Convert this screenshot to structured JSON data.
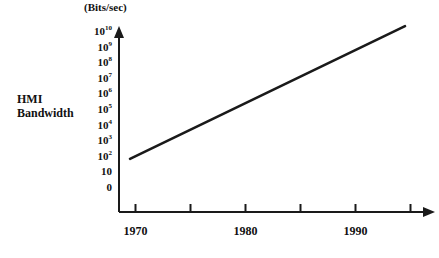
{
  "chart_data": {
    "type": "line",
    "title": "",
    "subtitle": "",
    "unit_label": "(Bits/sec)",
    "ylabel_line1": "HMI",
    "ylabel_line2": "Bandwidth",
    "xlabel": "",
    "yscale": "log",
    "ytick_labels": [
      "10",
      "",
      "10",
      "10",
      "10",
      "10",
      "10",
      "10",
      "10",
      "10",
      "10",
      "0"
    ],
    "y_ticks": [
      {
        "mantissa": "10",
        "exponent": "10",
        "value": 10000000000.0
      },
      {
        "mantissa": "10",
        "exponent": "9",
        "value": 1000000000.0
      },
      {
        "mantissa": "10",
        "exponent": "8",
        "value": 100000000.0
      },
      {
        "mantissa": "10",
        "exponent": "7",
        "value": 10000000.0
      },
      {
        "mantissa": "10",
        "exponent": "6",
        "value": 1000000.0
      },
      {
        "mantissa": "10",
        "exponent": "5",
        "value": 100000.0
      },
      {
        "mantissa": "10",
        "exponent": "4",
        "value": 10000
      },
      {
        "mantissa": "10",
        "exponent": "3",
        "value": 1000
      },
      {
        "mantissa": "10",
        "exponent": "2",
        "value": 100
      },
      {
        "mantissa": "10",
        "exponent": "",
        "value": 10
      },
      {
        "mantissa": "0",
        "exponent": "",
        "value": 0
      }
    ],
    "x_tick_values": [
      1970,
      1975,
      1980,
      1985,
      1990,
      1995
    ],
    "x_tick_labels": [
      "1970",
      "",
      "1980",
      "",
      "1990",
      ""
    ],
    "xlim": [
      1968.5,
      1996.5
    ],
    "ylim": [
      0,
      11
    ],
    "grid": false,
    "legend": false,
    "series": [
      {
        "name": "HMI Bandwidth",
        "color": "#1a1a1a",
        "x": [
          1969.5,
          1994.5
        ],
        "y": [
          100,
          30000000000
        ],
        "y_decades": [
          2,
          10.5
        ],
        "points": [
          {
            "year": 1969.5,
            "bits_per_sec": 100
          },
          {
            "year": 1994.5,
            "bits_per_sec": 30000000000
          }
        ]
      }
    ],
    "axis_color": "#1a1a1a",
    "background": "#ffffff"
  },
  "geometry": {
    "origin_x": 119,
    "origin_y": 212,
    "y_axis_top": 28,
    "x_axis_right": 433,
    "decade_px": 15.6,
    "zero_y": 190
  }
}
